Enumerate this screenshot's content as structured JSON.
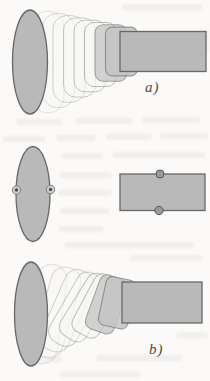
{
  "figure": {
    "panels": [
      {
        "id": "a",
        "label": "a)"
      },
      {
        "id": "b",
        "label": "b)"
      },
      {
        "id": "c",
        "label": "c)"
      }
    ]
  },
  "icons": {
    "ellipse_edge_markers": "circled-dot-marker",
    "rectangle_edge_markers": "filled-dot-marker"
  },
  "colors": {
    "paper": "#fbfaf8",
    "shape-fill": "#b9b9b9",
    "shape-stroke": "#686868",
    "ghost-stroke": "#9a9a9a",
    "ghost-fill-strong": "#c5c5c5",
    "marker-dark": "#4e4e4e",
    "label-color": "#4a4a4a"
  }
}
